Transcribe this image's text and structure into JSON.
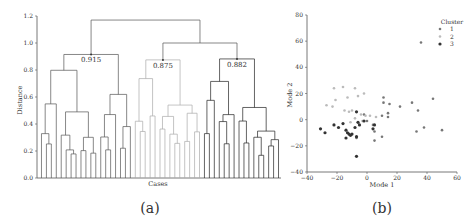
{
  "chart_data": [
    {
      "type": "dendrogram",
      "panel_label": "(a)",
      "title": "",
      "xlabel": "Cases",
      "ylabel": "Distance",
      "ylim": [
        0,
        1.2
      ],
      "yticks": [
        "0.0",
        "0.2",
        "0.4",
        "0.6",
        "0.8",
        "1.0",
        "1.2"
      ],
      "annotations": [
        {
          "text": "0.915",
          "x": 0.915
        },
        {
          "text": "0.875",
          "x": 0.875
        },
        {
          "text": "0.882",
          "x": 0.882
        }
      ],
      "root_height": 1.17,
      "clusters": [
        {
          "id": 1,
          "color": "#555555",
          "merge_height": 0.915,
          "leaves": 19
        },
        {
          "id": 2,
          "color": "#aaaaaa",
          "merge_height": 0.875,
          "leaves": 14
        },
        {
          "id": 3,
          "color": "#222222",
          "merge_height": 0.882,
          "leaves": 16
        }
      ],
      "cluster2_3_merge": 1.0
    },
    {
      "type": "scatter",
      "panel_label": "(b)",
      "xlabel": "Mode 1",
      "ylabel": "Mode 2",
      "xlim": [
        -40,
        60
      ],
      "ylim": [
        -40,
        80
      ],
      "xticks": [
        "-40",
        "-20",
        "0",
        "20",
        "40",
        "60"
      ],
      "yticks": [
        "-40",
        "-20",
        "0",
        "20",
        "40",
        "60",
        "80"
      ],
      "legend": {
        "title": "Cluster",
        "entries": [
          "1",
          "2",
          "3"
        ],
        "position": "upper right"
      },
      "series": [
        {
          "name": "1",
          "color": "#777777",
          "points": [
            [
              36,
              59
            ],
            [
              44,
              16
            ],
            [
              30,
              13
            ],
            [
              22,
              10
            ],
            [
              34,
              7
            ],
            [
              11,
              17
            ],
            [
              11,
              13
            ],
            [
              15,
              12
            ],
            [
              10,
              3
            ],
            [
              14,
              5
            ],
            [
              14,
              2
            ],
            [
              -2,
              4
            ],
            [
              4,
              -4
            ],
            [
              10,
              -13
            ],
            [
              -7,
              -14
            ],
            [
              5,
              -9
            ],
            [
              33,
              -9
            ],
            [
              38,
              -6
            ],
            [
              50,
              -8
            ],
            [
              5,
              -16
            ],
            [
              0,
              -1
            ]
          ]
        },
        {
          "name": "2",
          "color": "#bbbbbb",
          "points": [
            [
              -22,
              24
            ],
            [
              -16,
              25
            ],
            [
              -8,
              24
            ],
            [
              -6,
              18
            ],
            [
              -2,
              20
            ],
            [
              -21,
              15
            ],
            [
              -13,
              17
            ],
            [
              -27,
              11
            ],
            [
              -23,
              10
            ],
            [
              -15,
              7
            ],
            [
              -12,
              6
            ],
            [
              -4,
              4
            ],
            [
              -8,
              1
            ],
            [
              -3,
              -1
            ],
            [
              -1,
              3
            ],
            [
              2,
              3
            ],
            [
              -10,
              7
            ],
            [
              6,
              2
            ],
            [
              -11,
              -2
            ]
          ]
        },
        {
          "name": "3",
          "color": "#333333",
          "points": [
            [
              -31,
              -7
            ],
            [
              -28,
              -10
            ],
            [
              -22,
              -4
            ],
            [
              -19,
              -6
            ],
            [
              -16,
              -3
            ],
            [
              -14,
              -8
            ],
            [
              -13,
              -10
            ],
            [
              -12,
              -11
            ],
            [
              -11,
              -12
            ],
            [
              -10,
              -11
            ],
            [
              -8,
              -6
            ],
            [
              -7,
              -13
            ],
            [
              -14,
              -14
            ],
            [
              -6,
              -2
            ],
            [
              -5,
              -4
            ],
            [
              -7,
              6
            ],
            [
              -2,
              -1
            ],
            [
              4,
              -7
            ],
            [
              5,
              -4
            ],
            [
              -7,
              -28
            ]
          ]
        }
      ]
    }
  ]
}
